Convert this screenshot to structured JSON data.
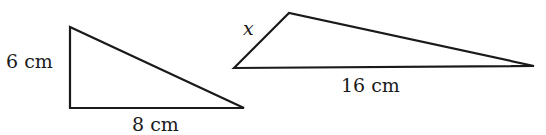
{
  "diagram": {
    "triangle_small": {
      "label_vertical": "6 cm",
      "label_base": "8 cm",
      "points": [
        [
          70,
          27
        ],
        [
          70,
          108
        ],
        [
          244,
          108
        ]
      ]
    },
    "triangle_large": {
      "label_short_side": "x",
      "label_base": "16 cm",
      "points": [
        [
          234,
          68
        ],
        [
          289,
          13
        ],
        [
          534,
          66
        ]
      ]
    },
    "stroke_color": "#1a1a1a"
  }
}
